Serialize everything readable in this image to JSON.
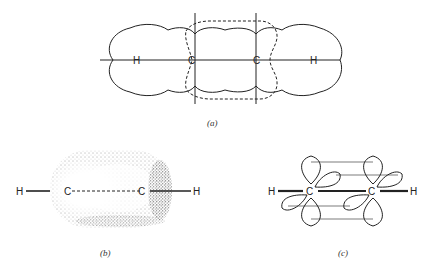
{
  "figure": {
    "panels": [
      {
        "id": "a",
        "caption": "(a)",
        "description": "Acetylene sigma framework with overlapping atomic spheres; dashed outline of pi orbital region",
        "atoms": [
          "H",
          "C",
          "C",
          "H"
        ]
      },
      {
        "id": "b",
        "caption": "(b)",
        "description": "Cylindrical pi electron cloud (stippled) around the C-C axis",
        "atoms": [
          "H",
          "C",
          "C",
          "H"
        ]
      },
      {
        "id": "c",
        "caption": "(c)",
        "description": "Two sets of overlapping p orbitals perpendicular to the H-C-C-H axis",
        "atoms": [
          "H",
          "C",
          "C",
          "H"
        ]
      }
    ]
  },
  "colors": {
    "line": "#222222",
    "background": "#ffffff",
    "stipple": "#444444"
  }
}
